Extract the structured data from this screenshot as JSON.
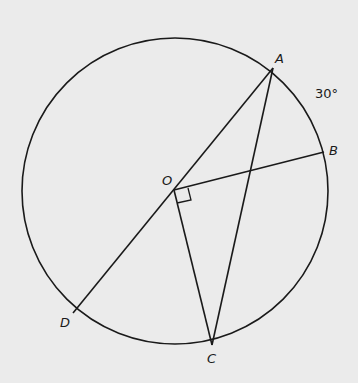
{
  "diagram": {
    "type": "circle-geometry",
    "circle": {
      "center": "O",
      "cx": 175,
      "cy": 191,
      "r": 153
    },
    "points": {
      "A": {
        "label": "A",
        "x": 273,
        "y": 68
      },
      "B": {
        "label": "B",
        "x": 324,
        "y": 152
      },
      "C": {
        "label": "C",
        "x": 212,
        "y": 345
      },
      "D": {
        "label": "D",
        "x": 73,
        "y": 313
      },
      "O": {
        "label": "O",
        "x": 174,
        "y": 190
      }
    },
    "segments": [
      "AD",
      "OB",
      "OC",
      "AC"
    ],
    "right_angle_at": "O",
    "arc_label": {
      "text": "30°",
      "arc": "AB"
    },
    "stroke_color": "#1a1a1a",
    "background_color": "#ebebeb"
  }
}
